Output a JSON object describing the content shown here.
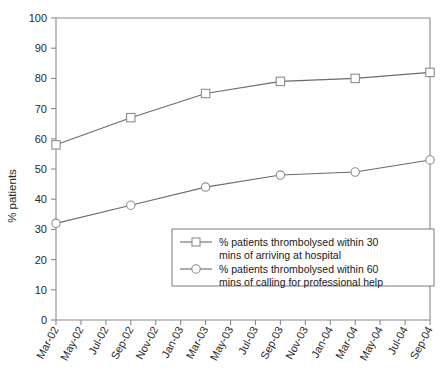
{
  "chart_data": {
    "type": "line",
    "title": "",
    "xlabel": "",
    "ylabel": "% patients",
    "ylim": [
      0,
      100
    ],
    "ytick_step": 10,
    "yticks": [
      0,
      10,
      20,
      30,
      40,
      50,
      60,
      70,
      80,
      90,
      100
    ],
    "grid": false,
    "legend_position": "inside-lower-right",
    "categories": [
      "Mar-02",
      "May-02",
      "Jul-02",
      "Sep-02",
      "Nov-02",
      "Jan-03",
      "Mar-03",
      "May-03",
      "Jul-03",
      "Sep-03",
      "Nov-03",
      "Jan-04",
      "Mar-04",
      "May-04",
      "Jul-04",
      "Sep-04"
    ],
    "marker_categories": [
      "Mar-02",
      "Sep-02",
      "Mar-03",
      "Sep-03",
      "Mar-04",
      "Sep-04"
    ],
    "series": [
      {
        "name": "% patients thrombolysed within 30 mins of arriving at hospital",
        "legend_line_1": "% patients thrombolysed within 30",
        "legend_line_2": "mins of arriving at hospital",
        "marker": "square",
        "x": [
          "Mar-02",
          "Sep-02",
          "Mar-03",
          "Sep-03",
          "Mar-04",
          "Sep-04"
        ],
        "values": [
          58,
          67,
          75,
          79,
          80,
          82
        ]
      },
      {
        "name": "% patients thrombolysed within 60 mins of calling for professional help",
        "legend_line_1": "% patients thrombolysed within 60",
        "legend_line_2": "mins of calling for professional help",
        "marker": "circle",
        "x": [
          "Mar-02",
          "Sep-02",
          "Mar-03",
          "Sep-03",
          "Mar-04",
          "Sep-04"
        ],
        "values": [
          32,
          38,
          44,
          48,
          49,
          53
        ]
      }
    ],
    "colors": {
      "line": "#6b6b6b",
      "axis": "#8a8a8a",
      "marker_fill": "#ffffff",
      "marker_stroke": "#8d8d8d",
      "text": "#1a1a1a",
      "background": "#ffffff"
    }
  }
}
